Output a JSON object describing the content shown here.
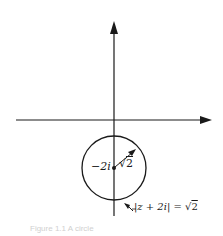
{
  "diagram": {
    "type": "complex-plane-circle",
    "axes": {
      "horizontal": {
        "label": ""
      },
      "vertical": {
        "label": ""
      }
    },
    "circle": {
      "center_label": "−2i",
      "radius_label_prefix": "√",
      "radius_label_value": "2",
      "equation_lhs": "|z + 2i| = ",
      "equation_rhs_prefix": "√",
      "equation_rhs_value": "2"
    },
    "caption": "Figure 1.1 A circle"
  },
  "colors": {
    "stroke": "#1a1a1a",
    "background": "#ffffff"
  }
}
